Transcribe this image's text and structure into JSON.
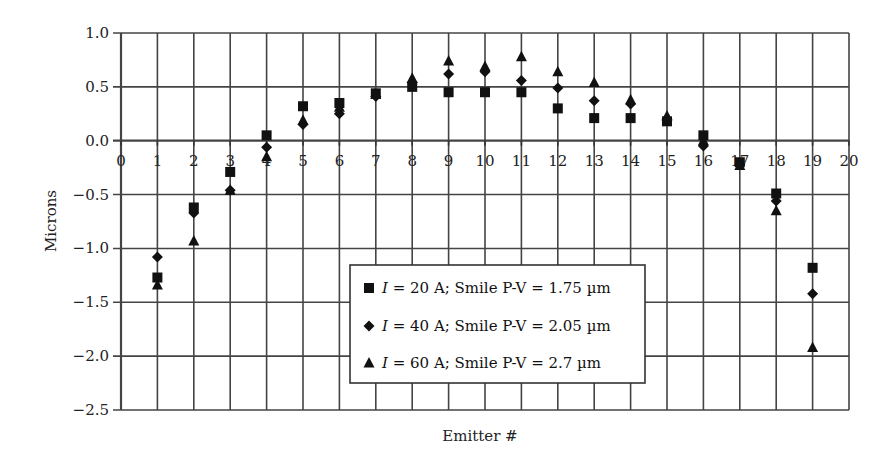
{
  "chart_data": {
    "type": "scatter",
    "title": "",
    "xlabel": "Emitter #",
    "ylabel": "Microns",
    "xlim": [
      0,
      20
    ],
    "ylim": [
      -2.5,
      1.0
    ],
    "xticks": [
      "0",
      "1",
      "2",
      "3",
      "4",
      "5",
      "6",
      "7",
      "8",
      "9",
      "10",
      "11",
      "12",
      "13",
      "14",
      "15",
      "16",
      "17",
      "18",
      "19",
      "20"
    ],
    "yticks": [
      "1.0",
      "0.5",
      "0.0",
      "-0.5",
      "-1.0",
      "-1.5",
      "-2.0",
      "-2.5"
    ],
    "ytick_values": [
      1.0,
      0.5,
      0.0,
      -0.5,
      -1.0,
      -1.5,
      -2.0,
      -2.5
    ],
    "grid": true,
    "legend_position": "bottom-center",
    "x": [
      1,
      2,
      3,
      4,
      5,
      6,
      7,
      8,
      9,
      10,
      11,
      12,
      13,
      14,
      15,
      16,
      17,
      18,
      19
    ],
    "series": [
      {
        "name": "I = 20 A; Smile P-V = 1.75 µm",
        "legend_italic": "I",
        "legend_rest": " = 20 A; Smile P-V = 1.75 µm",
        "marker": "square",
        "values": [
          -1.27,
          -0.62,
          -0.29,
          0.05,
          0.32,
          0.35,
          0.44,
          0.5,
          0.45,
          0.45,
          0.45,
          0.3,
          0.21,
          0.21,
          0.18,
          0.05,
          -0.2,
          -0.49,
          -1.18
        ]
      },
      {
        "name": "I = 40 A; Smile P-V = 2.05 µm",
        "legend_italic": "I",
        "legend_rest": " = 40 A; Smile P-V = 2.05 µm",
        "marker": "diamond",
        "values": [
          -1.08,
          -0.67,
          -0.46,
          -0.06,
          0.15,
          0.25,
          0.41,
          0.54,
          0.62,
          0.64,
          0.56,
          0.49,
          0.37,
          0.34,
          0.2,
          -0.05,
          -0.22,
          -0.56,
          -1.42
        ]
      },
      {
        "name": "I = 60 A; Smile P-V = 2.7 µm",
        "legend_italic": "I",
        "legend_rest": " = 60 A; Smile P-V = 2.7 µm",
        "marker": "triangle",
        "values": [
          -1.34,
          -0.93,
          -0.46,
          -0.15,
          0.19,
          0.31,
          0.43,
          0.58,
          0.74,
          0.69,
          0.78,
          0.64,
          0.54,
          0.38,
          0.23,
          0.0,
          -0.23,
          -0.65,
          -1.92
        ]
      }
    ]
  }
}
